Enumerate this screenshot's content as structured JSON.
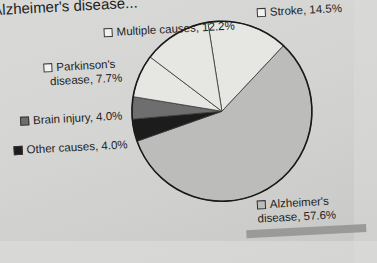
{
  "chart_data": {
    "type": "pie",
    "title": "Alzheimer's disease",
    "slices": [
      {
        "label": "Stroke",
        "value": 14.5,
        "color": "#e6e6e3"
      },
      {
        "label": "Alzheimer's disease",
        "value": 57.6,
        "color": "#bcbcba"
      },
      {
        "label": "Other causes",
        "value": 4.0,
        "color": "#1c1c1c"
      },
      {
        "label": "Brain injury",
        "value": 4.0,
        "color": "#6e6e6e"
      },
      {
        "label": "Parkinson's disease",
        "value": 7.7,
        "color": "#e6e6e3"
      },
      {
        "label": "Multiple causes",
        "value": 12.2,
        "color": "#e6e6e3"
      }
    ],
    "legend_position": "labels around pie"
  },
  "title": "Alzheimer's disease...",
  "labels": {
    "multiple": "Multiple causes, 12.2%",
    "stroke": "Stroke, 14.5%",
    "parkinsons_1": "Parkinson's",
    "parkinsons_2": "disease, 7.7%",
    "brain": "Brain injury, 4.0%",
    "other": "Other causes, 4.0%",
    "alz_1": "Alzheimer's",
    "alz_2": "disease, 57.6%"
  },
  "colors": {
    "light": "#e6e6e3",
    "medium": "#bcbcba",
    "dark": "#6e6e6e",
    "black": "#1c1c1c"
  }
}
